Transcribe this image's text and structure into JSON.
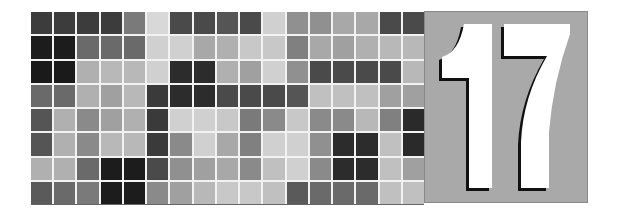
{
  "chapter": {
    "number": "17",
    "box_color": "#a9a9a9",
    "digit_color": "#ffffff",
    "shadow_color": "#111111"
  },
  "mosaic": {
    "columns": 17,
    "rows": 8,
    "cells": [
      [
        "#3c3c3c",
        "#3c3c3c",
        "#3c3c3c",
        "#3c3c3c",
        "#7a7a7a",
        "#d8d8d8",
        "#4a4a4a",
        "#4a4a4a",
        "#555555",
        "#4a4a4a",
        "#d0d0d0",
        "#909090",
        "#909090",
        "#a8a8a8",
        "#a8a8a8",
        "#4a4a4a",
        "#4a4a4a"
      ],
      [
        "#1c1c1c",
        "#1c1c1c",
        "#6a6a6a",
        "#6a6a6a",
        "#6a6a6a",
        "#d0d0d0",
        "#d0d0d0",
        "#a8a8a8",
        "#b0b0b0",
        "#c8c8c8",
        "#c8c8c8",
        "#808080",
        "#a8a8a8",
        "#a0a0a0",
        "#b0b0b0",
        "#b8b8b8",
        "#b8b8b8"
      ],
      [
        "#1a1a1a",
        "#1a1a1a",
        "#b0b0b0",
        "#b8b8b8",
        "#b8b8b8",
        "#d0d0d0",
        "#2c2c2c",
        "#2c2c2c",
        "#b0b0b0",
        "#a0a0a0",
        "#d0d0d0",
        "#909090",
        "#4a4a4a",
        "#4a4a4a",
        "#4a4a4a",
        "#4a4a4a",
        "#b8b8b8"
      ],
      [
        "#6a6a6a",
        "#6a6a6a",
        "#b0b0b0",
        "#a0a0a0",
        "#b8b8b8",
        "#3a3a3a",
        "#2c2c2c",
        "#2c2c2c",
        "#4a4a4a",
        "#4a4a4a",
        "#4a4a4a",
        "#555555",
        "#c0c0c0",
        "#c0c0c0",
        "#c0c0c0",
        "#a0a0a0",
        "#a0a0a0"
      ],
      [
        "#555555",
        "#b0b0b0",
        "#8a8a8a",
        "#a0a0a0",
        "#b0b0b0",
        "#3a3a3a",
        "#d0d0d0",
        "#d0d0d0",
        "#c8c8c8",
        "#7a7a7a",
        "#8a8a8a",
        "#c8c8c8",
        "#8a8a8a",
        "#8a8a8a",
        "#b8b8b8",
        "#808080",
        "#2a2a2a"
      ],
      [
        "#555555",
        "#b0b0b0",
        "#8a8a8a",
        "#b8b8b8",
        "#b8b8b8",
        "#3a3a3a",
        "#8a8a8a",
        "#d0d0d0",
        "#a8a8a8",
        "#808080",
        "#d0d0d0",
        "#d0d0d0",
        "#909090",
        "#2c2c2c",
        "#2c2c2c",
        "#c0c0c0",
        "#2a2a2a"
      ],
      [
        "#b0b0b0",
        "#b0b0b0",
        "#6a6a6a",
        "#1c1c1c",
        "#1c1c1c",
        "#4a4a4a",
        "#909090",
        "#a0a0a0",
        "#a8a8a8",
        "#8a8a8a",
        "#c0c0c0",
        "#d0d0d0",
        "#8a8a8a",
        "#2c2c2c",
        "#2c2c2c",
        "#c0c0c0",
        "#a0a0a0"
      ],
      [
        "#5a5a5a",
        "#6a6a6a",
        "#7a7a7a",
        "#1c1c1c",
        "#1c1c1c",
        "#8a8a8a",
        "#a0a0a0",
        "#b8b8b8",
        "#c8c8c8",
        "#c8c8c8",
        "#c0c0c0",
        "#5a5a5a",
        "#6a6a6a",
        "#6a6a6a",
        "#6a6a6a",
        "#c0c0c0",
        "#c0c0c0"
      ]
    ]
  }
}
